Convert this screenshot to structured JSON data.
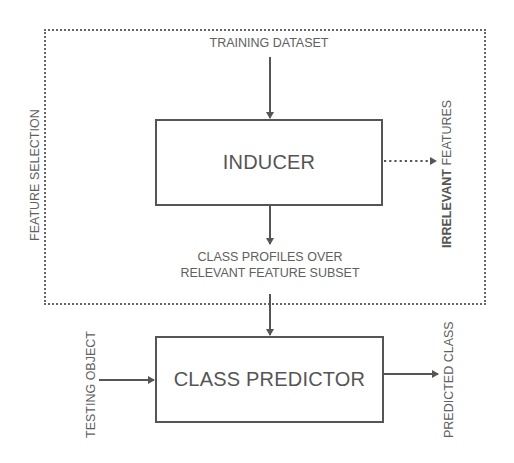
{
  "diagram": {
    "frame_label": "FEATURE SELECTION",
    "nodes": {
      "inducer": {
        "label": "INDUCER"
      },
      "class_predictor": {
        "label": "CLASS PREDICTOR"
      }
    },
    "labels": {
      "training_dataset": "TRAINING DATASET",
      "class_profiles_line1": "CLASS PROFILES OVER",
      "class_profiles_line2": "RELEVANT FEATURE SUBSET",
      "irrelevant_bold": "IRRELEVANT",
      "irrelevant_rest": " FEATURES",
      "testing_object": "TESTING OBJECT",
      "predicted_class": "PREDICTED CLASS"
    },
    "edges": [
      {
        "from": "training_dataset",
        "to": "inducer",
        "style": "solid"
      },
      {
        "from": "inducer",
        "to": "irrelevant_features",
        "style": "dotted"
      },
      {
        "from": "inducer",
        "to": "class_profiles",
        "style": "solid"
      },
      {
        "from": "class_profiles",
        "to": "class_predictor",
        "style": "solid"
      },
      {
        "from": "testing_object",
        "to": "class_predictor",
        "style": "solid"
      },
      {
        "from": "class_predictor",
        "to": "predicted_class",
        "style": "solid"
      }
    ],
    "colors": {
      "line": "#555555",
      "text": "#606060",
      "background": "#ffffff"
    }
  }
}
